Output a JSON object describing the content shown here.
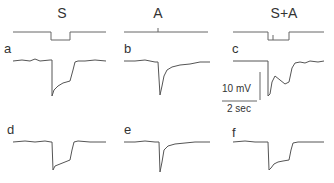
{
  "figure": {
    "columns": [
      {
        "header": "S"
      },
      {
        "header": "A"
      },
      {
        "header": "S+A"
      }
    ],
    "panels": {
      "top_row": [
        "a",
        "b",
        "c"
      ],
      "bottom_row": [
        "d",
        "e",
        "f"
      ]
    },
    "scale_bar": {
      "voltage_label": "10 mV",
      "time_label": "2 sec"
    },
    "colors": {
      "trace": "#555555",
      "stimulus": "#666666",
      "text": "#333333",
      "background": "#ffffff"
    }
  }
}
